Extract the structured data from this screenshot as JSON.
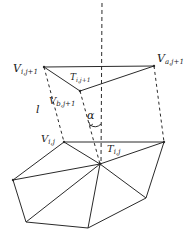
{
  "diagram": {
    "labels": {
      "v_i_j1": {
        "main": "V",
        "sub": "i,j+1"
      },
      "v_a_j1": {
        "main": "V",
        "sub": "a,j+1"
      },
      "v_b_j1": {
        "main": "V",
        "sub": "b,j+1"
      },
      "t_i_j1": {
        "main": "T",
        "sub": "i,j+1"
      },
      "v_i_j": {
        "main": "V",
        "sub": "i,j"
      },
      "t_i_j": {
        "main": "T",
        "sub": "i,j"
      },
      "l": "l",
      "alpha": "α"
    },
    "colors": {
      "stroke": "#2a2a2a",
      "text": "#1a1a1a",
      "background": "#ffffff"
    }
  }
}
